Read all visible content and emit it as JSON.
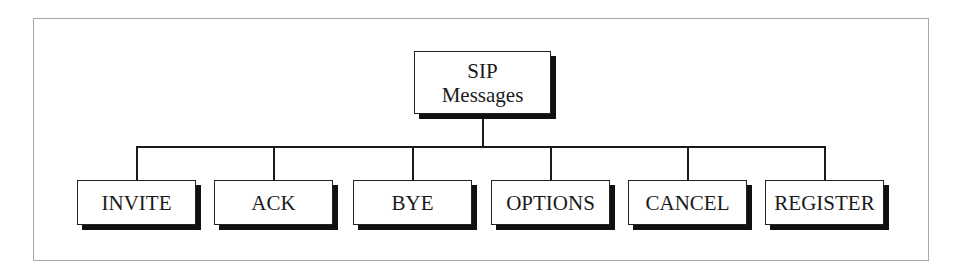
{
  "diagram": {
    "title": "SIP Messages",
    "root": {
      "line1": "SIP",
      "line2": "Messages"
    },
    "children": [
      {
        "label": "INVITE"
      },
      {
        "label": "ACK"
      },
      {
        "label": "BYE"
      },
      {
        "label": "OPTIONS"
      },
      {
        "label": "CANCEL"
      },
      {
        "label": "REGISTER"
      }
    ],
    "colors": {
      "border": "#222222",
      "shadow": "#111111",
      "frame": "#a8a8a8",
      "background": "#ffffff"
    }
  }
}
